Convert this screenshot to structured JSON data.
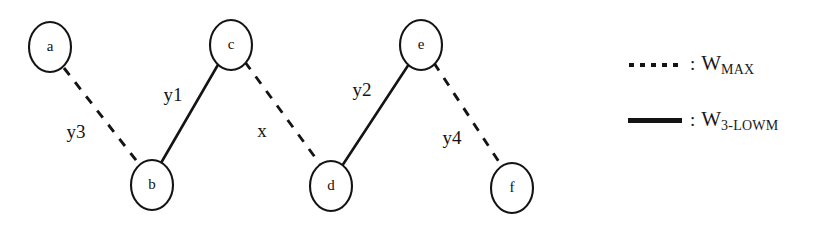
{
  "diagram": {
    "type": "graph",
    "nodes": [
      {
        "id": "a",
        "label": "a",
        "cx": 50,
        "cy": 47,
        "rx": 21,
        "ry": 25
      },
      {
        "id": "b",
        "label": "b",
        "cx": 152,
        "cy": 185,
        "rx": 21,
        "ry": 25
      },
      {
        "id": "c",
        "label": "c",
        "cx": 231,
        "cy": 45,
        "rx": 21,
        "ry": 25
      },
      {
        "id": "d",
        "label": "d",
        "cx": 331,
        "cy": 186,
        "rx": 21,
        "ry": 25
      },
      {
        "id": "e",
        "label": "e",
        "cx": 421,
        "cy": 45,
        "rx": 21,
        "ry": 25
      },
      {
        "id": "f",
        "label": "f",
        "cx": 512,
        "cy": 188,
        "rx": 21,
        "ry": 25
      }
    ],
    "edges": [
      {
        "id": "a-b",
        "from": "a",
        "to": "b",
        "style": "dashed",
        "label": "y3",
        "label_x": 76,
        "label_y": 134
      },
      {
        "id": "b-c",
        "from": "b",
        "to": "c",
        "style": "solid",
        "label": "y1",
        "label_x": 173,
        "label_y": 97
      },
      {
        "id": "c-d",
        "from": "c",
        "to": "d",
        "style": "dashed",
        "label": "x",
        "label_x": 262,
        "label_y": 133
      },
      {
        "id": "d-e",
        "from": "d",
        "to": "e",
        "style": "solid",
        "label": "y2",
        "label_x": 362,
        "label_y": 92
      },
      {
        "id": "e-f",
        "from": "e",
        "to": "f",
        "style": "dashed",
        "label": "y4",
        "label_x": 452,
        "label_y": 140
      }
    ]
  },
  "legend": {
    "entries": [
      {
        "id": "w-max",
        "sample": "dotted-line",
        "separator": ":",
        "symbol": "W",
        "subscript": "MAX"
      },
      {
        "id": "w-3-lowm",
        "sample": "solid-line",
        "separator": ":",
        "symbol": "W",
        "subscript": "3-LOWM"
      }
    ]
  },
  "colors": {
    "ink": "#141414",
    "background": "#ffffff"
  }
}
